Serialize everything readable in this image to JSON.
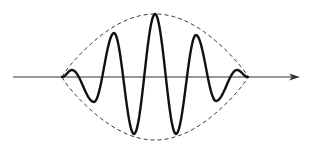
{
  "diagram": {
    "title": "",
    "colors": {
      "background": "#ffffff",
      "wave": "#111111",
      "envelope": "#333333",
      "axis": "#333333"
    },
    "axis": {
      "x_start": 13,
      "x_end": 300,
      "y": 77,
      "arrow": true
    },
    "envelope": {
      "start_x": 62,
      "end_x": 248,
      "center_x": 155,
      "top_y": 14,
      "bottom_y": 140,
      "style": "dashed"
    },
    "wave": {
      "extrema": [
        {
          "x": 62,
          "y": 77
        },
        {
          "x": 72,
          "y": 70
        },
        {
          "x": 94,
          "y": 102
        },
        {
          "x": 114,
          "y": 33
        },
        {
          "x": 134,
          "y": 134
        },
        {
          "x": 155,
          "y": 14
        },
        {
          "x": 176,
          "y": 134
        },
        {
          "x": 196,
          "y": 35
        },
        {
          "x": 216,
          "y": 101
        },
        {
          "x": 237,
          "y": 70
        },
        {
          "x": 248,
          "y": 77
        }
      ],
      "stroke_width": 2.4
    }
  }
}
